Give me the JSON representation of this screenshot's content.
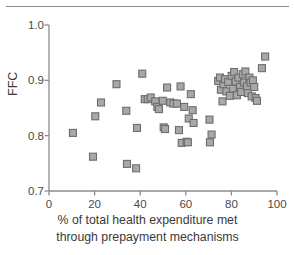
{
  "chart_data": {
    "type": "scatter",
    "title": "",
    "xlabel": "% of total health expenditure met through prepayment mechanisms",
    "xlabel_line1": "% of total health expenditure met",
    "xlabel_line2": "through prepayment mechanisms",
    "ylabel": "FFC",
    "xlim": [
      0,
      100
    ],
    "ylim": [
      0.7,
      1.0
    ],
    "xticks": [
      0,
      20,
      40,
      60,
      80,
      100
    ],
    "xtick_labels": [
      "0",
      "20",
      "40",
      "60",
      "80",
      "100"
    ],
    "yticks": [
      0.7,
      0.8,
      0.9,
      1.0
    ],
    "ytick_labels": [
      "0.7",
      "0.8",
      "0.9",
      "1.0"
    ],
    "grid": false,
    "legend": null,
    "marker": {
      "shape": "square",
      "fill": "#a8a8a8",
      "edge": "#6d6d6d",
      "size_px": 7
    },
    "axis_color": "#8d8d8d",
    "series": [
      {
        "name": "countries",
        "points": [
          [
            10.5,
            0.805
          ],
          [
            19.3,
            0.762
          ],
          [
            20.3,
            0.835
          ],
          [
            22.8,
            0.86
          ],
          [
            29.6,
            0.893
          ],
          [
            33.9,
            0.845
          ],
          [
            34.2,
            0.749
          ],
          [
            38.2,
            0.741
          ],
          [
            38.6,
            0.814
          ],
          [
            40.9,
            0.912
          ],
          [
            42.0,
            0.866
          ],
          [
            43.3,
            0.866
          ],
          [
            44.6,
            0.869
          ],
          [
            46.6,
            0.862
          ],
          [
            47.5,
            0.852
          ],
          [
            48.2,
            0.848
          ],
          [
            49.9,
            0.863
          ],
          [
            50.3,
            0.815
          ],
          [
            50.9,
            0.812
          ],
          [
            51.8,
            0.887
          ],
          [
            53.2,
            0.86
          ],
          [
            54.6,
            0.858
          ],
          [
            56.1,
            0.858
          ],
          [
            57.0,
            0.81
          ],
          [
            57.7,
            0.889
          ],
          [
            58.2,
            0.787
          ],
          [
            59.3,
            0.852
          ],
          [
            60.4,
            0.789
          ],
          [
            60.9,
            0.788
          ],
          [
            61.3,
            0.831
          ],
          [
            62.2,
            0.875
          ],
          [
            63.0,
            0.846
          ],
          [
            63.4,
            0.823
          ],
          [
            70.4,
            0.829
          ],
          [
            70.6,
            0.788
          ],
          [
            71.3,
            0.802
          ],
          [
            74.2,
            0.899
          ],
          [
            75.0,
            0.905
          ],
          [
            75.4,
            0.883
          ],
          [
            76.1,
            0.862
          ],
          [
            76.5,
            0.893
          ],
          [
            77.2,
            0.902
          ],
          [
            77.8,
            0.88
          ],
          [
            78.6,
            0.897
          ],
          [
            79.3,
            0.872
          ],
          [
            80.1,
            0.908
          ],
          [
            80.6,
            0.885
          ],
          [
            81.2,
            0.915
          ],
          [
            81.9,
            0.898
          ],
          [
            82.4,
            0.873
          ],
          [
            83.1,
            0.905
          ],
          [
            83.8,
            0.888
          ],
          [
            84.3,
            0.879
          ],
          [
            85.0,
            0.911
          ],
          [
            85.6,
            0.896
          ],
          [
            86.1,
            0.916
          ],
          [
            86.8,
            0.889
          ],
          [
            87.2,
            0.877
          ],
          [
            87.9,
            0.905
          ],
          [
            88.4,
            0.896
          ],
          [
            88.9,
            0.871
          ],
          [
            89.4,
            0.9
          ],
          [
            90.0,
            0.888
          ],
          [
            90.6,
            0.868
          ],
          [
            91.2,
            0.863
          ],
          [
            93.4,
            0.922
          ],
          [
            94.8,
            0.943
          ]
        ]
      }
    ]
  }
}
